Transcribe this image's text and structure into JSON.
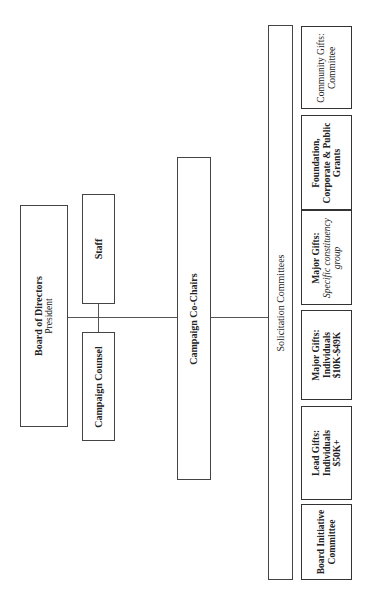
{
  "chart": {
    "orientation": "rotated -90deg",
    "board": {
      "title": "Board of Directors",
      "subtitle": "President"
    },
    "staff": {
      "label": "Staff"
    },
    "counsel": {
      "label": "Campaign Counsel"
    },
    "cochairs": {
      "label": "Campaign Co-Chairs"
    },
    "solicitation": {
      "label": "Solicitation Committees"
    },
    "committees": [
      {
        "line1": "Community Gifts:",
        "line2": "Committee",
        "line3": ""
      },
      {
        "line1": "Foundation,",
        "line2": "Corporate & Public",
        "line3": "Grants"
      },
      {
        "line1": "Major Gifts:",
        "line2": "Specific constituency",
        "line3": "group"
      },
      {
        "line1": "Major Gifts:",
        "line2": "Individuals",
        "line3": "$10K-$49K"
      },
      {
        "line1": "Lead Gifts:",
        "line2": "Individuals",
        "line3": "$50K+"
      },
      {
        "line1": "Board Initiative",
        "line2": "Committee",
        "line3": ""
      }
    ]
  },
  "colors": {
    "border": "#444444",
    "background": "#ffffff",
    "text": "#222222"
  }
}
